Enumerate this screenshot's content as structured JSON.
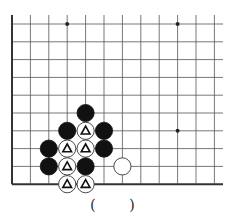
{
  "diagram": {
    "type": "go-board-problem",
    "grid": {
      "columns": 12,
      "rows": 10,
      "origin_x": 12,
      "origin_y": 24,
      "spacing_x": 18.4,
      "spacing_y": 17.8,
      "right_extent": 223,
      "line_color": "#555555",
      "edge_color": "#333333",
      "left_edge_thick": true,
      "bottom_edge_thick": true
    },
    "star_points": [
      {
        "col": 3,
        "row": 0
      },
      {
        "col": 9,
        "row": 0
      },
      {
        "col": 9,
        "row": 6
      }
    ],
    "stones": [
      {
        "col": 4,
        "row": 5,
        "color": "black",
        "mark": ""
      },
      {
        "col": 3,
        "row": 6,
        "color": "black",
        "mark": ""
      },
      {
        "col": 4,
        "row": 6,
        "color": "white",
        "mark": "triangle"
      },
      {
        "col": 5,
        "row": 6,
        "color": "black",
        "mark": ""
      },
      {
        "col": 2,
        "row": 7,
        "color": "black",
        "mark": ""
      },
      {
        "col": 3,
        "row": 7,
        "color": "white",
        "mark": "triangle"
      },
      {
        "col": 4,
        "row": 7,
        "color": "white",
        "mark": "triangle"
      },
      {
        "col": 5,
        "row": 7,
        "color": "black",
        "mark": ""
      },
      {
        "col": 2,
        "row": 8,
        "color": "black",
        "mark": ""
      },
      {
        "col": 3,
        "row": 8,
        "color": "white",
        "mark": "triangle"
      },
      {
        "col": 4,
        "row": 8,
        "color": "black",
        "mark": ""
      },
      {
        "col": 6,
        "row": 8,
        "color": "white",
        "mark": ""
      },
      {
        "col": 3,
        "row": 9,
        "color": "white",
        "mark": "triangle"
      },
      {
        "col": 4,
        "row": 9,
        "color": "white",
        "mark": "triangle"
      }
    ],
    "answer_blank": {
      "open": "(",
      "close": ")"
    }
  }
}
